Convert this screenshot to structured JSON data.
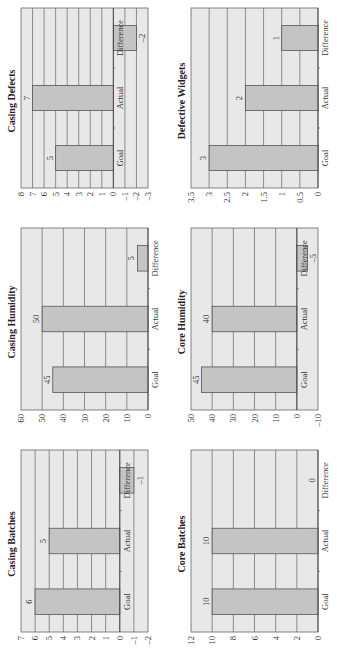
{
  "page": {
    "orientation": "rotated-90-ccw",
    "plot_bg": "#e8e8e8",
    "bar_fill": "#c4c4c4",
    "bar_stroke": "#555555",
    "grid_color": "#666666"
  },
  "chart_data": [
    {
      "id": "casing-batches",
      "type": "bar",
      "title": "Casing Batches",
      "categories": [
        "Goal",
        "Actual",
        "Difference"
      ],
      "values": [
        6,
        5,
        -1
      ],
      "value_labels": [
        "6",
        "5",
        "–1"
      ],
      "ylim": [
        -2,
        7
      ],
      "yticks": [
        -2,
        -1,
        0,
        1,
        2,
        3,
        4,
        5,
        6,
        7
      ],
      "ytick_labels": [
        "–2",
        "–1",
        "0",
        "1",
        "2",
        "3",
        "4",
        "5",
        "6",
        "7"
      ],
      "grid": true,
      "legend": null,
      "xlabel": "",
      "ylabel": "",
      "cell": {
        "x": 8,
        "y": 4,
        "w": 212,
        "h": 160
      }
    },
    {
      "id": "casing-humidity",
      "type": "bar",
      "title": "Casing Humidity",
      "categories": [
        "Goal",
        "Actual",
        "Difference"
      ],
      "values": [
        45,
        50,
        5
      ],
      "value_labels": [
        "45",
        "50",
        "5"
      ],
      "ylim": [
        0,
        60
      ],
      "yticks": [
        0,
        10,
        20,
        30,
        40,
        50,
        60
      ],
      "ytick_labels": [
        "0",
        "10",
        "20",
        "30",
        "40",
        "50",
        "60"
      ],
      "grid": true,
      "legend": null,
      "xlabel": "",
      "ylabel": "",
      "cell": {
        "x": 230,
        "y": 4,
        "w": 212,
        "h": 160
      }
    },
    {
      "id": "casing-defects",
      "type": "bar",
      "title": "Casing Defects",
      "categories": [
        "Goal",
        "Actual",
        "Difference"
      ],
      "values": [
        5,
        7,
        -2
      ],
      "value_labels": [
        "5",
        "7",
        "–2"
      ],
      "ylim": [
        -3,
        8
      ],
      "yticks": [
        -3,
        -2,
        -1,
        0,
        1,
        2,
        3,
        4,
        5,
        6,
        7,
        8
      ],
      "ytick_labels": [
        "–3",
        "–2",
        "–1",
        "0",
        "1",
        "2",
        "3",
        "4",
        "5",
        "6",
        "7",
        "8"
      ],
      "grid": true,
      "legend": null,
      "xlabel": "",
      "ylabel": "",
      "cell": {
        "x": 452,
        "y": 4,
        "w": 210,
        "h": 160
      }
    },
    {
      "id": "core-batches",
      "type": "bar",
      "title": "Core Batches",
      "categories": [
        "Goal",
        "Actual",
        "Difference"
      ],
      "values": [
        10,
        10,
        0
      ],
      "value_labels": [
        "10",
        "10",
        "0"
      ],
      "ylim": [
        0,
        12
      ],
      "yticks": [
        0,
        2,
        4,
        6,
        8,
        10,
        12
      ],
      "ytick_labels": [
        "0",
        "2",
        "4",
        "6",
        "8",
        "10",
        "12"
      ],
      "grid": true,
      "legend": null,
      "xlabel": "",
      "ylabel": "",
      "cell": {
        "x": 8,
        "y": 174,
        "w": 212,
        "h": 160
      }
    },
    {
      "id": "core-humidity",
      "type": "bar",
      "title": "Core Humidity",
      "categories": [
        "Goal",
        "Actual",
        "Difference"
      ],
      "values": [
        45,
        40,
        -5
      ],
      "value_labels": [
        "45",
        "40",
        "–5"
      ],
      "ylim": [
        -10,
        50
      ],
      "yticks": [
        -10,
        0,
        10,
        20,
        30,
        40,
        50
      ],
      "ytick_labels": [
        "–10",
        "0",
        "10",
        "20",
        "30",
        "40",
        "50"
      ],
      "grid": true,
      "legend": null,
      "xlabel": "",
      "ylabel": "",
      "cell": {
        "x": 230,
        "y": 174,
        "w": 212,
        "h": 160
      }
    },
    {
      "id": "defective-widgets",
      "type": "bar",
      "title": "Defective Widgets",
      "categories": [
        "Goal",
        "Actual",
        "Difference"
      ],
      "values": [
        3,
        2,
        1
      ],
      "value_labels": [
        "3",
        "2",
        "1"
      ],
      "ylim": [
        0,
        3.5
      ],
      "yticks": [
        0,
        0.5,
        1,
        1.5,
        2,
        2.5,
        3,
        3.5
      ],
      "ytick_labels": [
        "0",
        "0.5",
        "1",
        "1.5",
        "2",
        "2.5",
        "3",
        "3.5"
      ],
      "grid": true,
      "legend": null,
      "xlabel": "",
      "ylabel": "",
      "cell": {
        "x": 452,
        "y": 174,
        "w": 210,
        "h": 160
      }
    }
  ]
}
